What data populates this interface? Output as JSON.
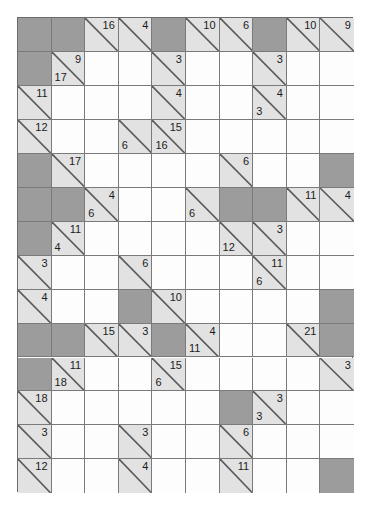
{
  "puzzle": {
    "name": "Kakuro Puzzle Grid",
    "type": "kakuro",
    "columns": 10,
    "rows": 14,
    "grid_origin": {
      "x": 17,
      "y": 17
    },
    "cell_width": 33.6,
    "cell_height": 33.95,
    "colors": {
      "block": "#9c9c9c",
      "clue": "#e2e2e2",
      "empty": "#fdfdfd",
      "grid_line": "#7a7a7a",
      "border": "#6b6b6b",
      "text": "#1b1b1b"
    },
    "legend": {
      "down_label": "down",
      "across_label": "across"
    },
    "cells": [
      {
        "r": 0,
        "c": 0,
        "kind": "block"
      },
      {
        "r": 0,
        "c": 1,
        "kind": "block"
      },
      {
        "r": 0,
        "c": 2,
        "kind": "clue",
        "down": "16"
      },
      {
        "r": 0,
        "c": 3,
        "kind": "clue",
        "down": "4"
      },
      {
        "r": 0,
        "c": 4,
        "kind": "block"
      },
      {
        "r": 0,
        "c": 5,
        "kind": "clue",
        "down": "10"
      },
      {
        "r": 0,
        "c": 6,
        "kind": "clue",
        "down": "6"
      },
      {
        "r": 0,
        "c": 7,
        "kind": "block"
      },
      {
        "r": 0,
        "c": 8,
        "kind": "clue",
        "down": "10"
      },
      {
        "r": 0,
        "c": 9,
        "kind": "clue",
        "down": "9"
      },
      {
        "r": 1,
        "c": 0,
        "kind": "block"
      },
      {
        "r": 1,
        "c": 1,
        "kind": "clue",
        "down": "9",
        "across": "17"
      },
      {
        "r": 1,
        "c": 2,
        "kind": "empty"
      },
      {
        "r": 1,
        "c": 3,
        "kind": "empty"
      },
      {
        "r": 1,
        "c": 4,
        "kind": "clue",
        "down": "3"
      },
      {
        "r": 1,
        "c": 5,
        "kind": "empty"
      },
      {
        "r": 1,
        "c": 6,
        "kind": "empty"
      },
      {
        "r": 1,
        "c": 7,
        "kind": "clue",
        "down": "3"
      },
      {
        "r": 1,
        "c": 8,
        "kind": "empty"
      },
      {
        "r": 1,
        "c": 9,
        "kind": "empty"
      },
      {
        "r": 2,
        "c": 0,
        "kind": "clue",
        "down": "11"
      },
      {
        "r": 2,
        "c": 1,
        "kind": "empty"
      },
      {
        "r": 2,
        "c": 2,
        "kind": "empty"
      },
      {
        "r": 2,
        "c": 3,
        "kind": "empty"
      },
      {
        "r": 2,
        "c": 4,
        "kind": "clue",
        "down": "4"
      },
      {
        "r": 2,
        "c": 5,
        "kind": "empty"
      },
      {
        "r": 2,
        "c": 6,
        "kind": "empty"
      },
      {
        "r": 2,
        "c": 7,
        "kind": "clue",
        "down": "4",
        "across": "3"
      },
      {
        "r": 2,
        "c": 8,
        "kind": "empty"
      },
      {
        "r": 2,
        "c": 9,
        "kind": "empty"
      },
      {
        "r": 3,
        "c": 0,
        "kind": "clue",
        "down": "12"
      },
      {
        "r": 3,
        "c": 1,
        "kind": "empty"
      },
      {
        "r": 3,
        "c": 2,
        "kind": "empty"
      },
      {
        "r": 3,
        "c": 3,
        "kind": "clue",
        "across": "6"
      },
      {
        "r": 3,
        "c": 4,
        "kind": "clue",
        "down": "15",
        "across": "16"
      },
      {
        "r": 3,
        "c": 5,
        "kind": "empty"
      },
      {
        "r": 3,
        "c": 6,
        "kind": "empty"
      },
      {
        "r": 3,
        "c": 7,
        "kind": "empty"
      },
      {
        "r": 3,
        "c": 8,
        "kind": "empty"
      },
      {
        "r": 3,
        "c": 9,
        "kind": "empty"
      },
      {
        "r": 4,
        "c": 0,
        "kind": "block"
      },
      {
        "r": 4,
        "c": 1,
        "kind": "clue",
        "down": "17"
      },
      {
        "r": 4,
        "c": 2,
        "kind": "empty"
      },
      {
        "r": 4,
        "c": 3,
        "kind": "empty"
      },
      {
        "r": 4,
        "c": 4,
        "kind": "empty"
      },
      {
        "r": 4,
        "c": 5,
        "kind": "empty"
      },
      {
        "r": 4,
        "c": 6,
        "kind": "clue",
        "down": "6"
      },
      {
        "r": 4,
        "c": 7,
        "kind": "empty"
      },
      {
        "r": 4,
        "c": 8,
        "kind": "empty"
      },
      {
        "r": 4,
        "c": 9,
        "kind": "block"
      },
      {
        "r": 5,
        "c": 0,
        "kind": "block"
      },
      {
        "r": 5,
        "c": 1,
        "kind": "block"
      },
      {
        "r": 5,
        "c": 2,
        "kind": "clue",
        "down": "4",
        "across": "6"
      },
      {
        "r": 5,
        "c": 3,
        "kind": "empty"
      },
      {
        "r": 5,
        "c": 4,
        "kind": "empty"
      },
      {
        "r": 5,
        "c": 5,
        "kind": "clue",
        "across": "6"
      },
      {
        "r": 5,
        "c": 6,
        "kind": "block"
      },
      {
        "r": 5,
        "c": 7,
        "kind": "block"
      },
      {
        "r": 5,
        "c": 8,
        "kind": "clue",
        "down": "11"
      },
      {
        "r": 5,
        "c": 9,
        "kind": "clue",
        "down": "4"
      },
      {
        "r": 6,
        "c": 0,
        "kind": "block"
      },
      {
        "r": 6,
        "c": 1,
        "kind": "clue",
        "down": "11",
        "across": "4"
      },
      {
        "r": 6,
        "c": 2,
        "kind": "empty"
      },
      {
        "r": 6,
        "c": 3,
        "kind": "empty"
      },
      {
        "r": 6,
        "c": 4,
        "kind": "empty"
      },
      {
        "r": 6,
        "c": 5,
        "kind": "empty"
      },
      {
        "r": 6,
        "c": 6,
        "kind": "clue",
        "across": "12"
      },
      {
        "r": 6,
        "c": 7,
        "kind": "clue",
        "down": "3"
      },
      {
        "r": 6,
        "c": 8,
        "kind": "empty"
      },
      {
        "r": 6,
        "c": 9,
        "kind": "empty"
      },
      {
        "r": 7,
        "c": 0,
        "kind": "clue",
        "down": "3"
      },
      {
        "r": 7,
        "c": 1,
        "kind": "empty"
      },
      {
        "r": 7,
        "c": 2,
        "kind": "empty"
      },
      {
        "r": 7,
        "c": 3,
        "kind": "clue",
        "down": "6"
      },
      {
        "r": 7,
        "c": 4,
        "kind": "empty"
      },
      {
        "r": 7,
        "c": 5,
        "kind": "empty"
      },
      {
        "r": 7,
        "c": 6,
        "kind": "empty"
      },
      {
        "r": 7,
        "c": 7,
        "kind": "clue",
        "down": "11",
        "across": "6"
      },
      {
        "r": 7,
        "c": 8,
        "kind": "empty"
      },
      {
        "r": 7,
        "c": 9,
        "kind": "empty"
      },
      {
        "r": 8,
        "c": 0,
        "kind": "clue",
        "down": "4"
      },
      {
        "r": 8,
        "c": 1,
        "kind": "empty"
      },
      {
        "r": 8,
        "c": 2,
        "kind": "empty"
      },
      {
        "r": 8,
        "c": 3,
        "kind": "block"
      },
      {
        "r": 8,
        "c": 4,
        "kind": "clue",
        "down": "10"
      },
      {
        "r": 8,
        "c": 5,
        "kind": "empty"
      },
      {
        "r": 8,
        "c": 6,
        "kind": "empty"
      },
      {
        "r": 8,
        "c": 7,
        "kind": "empty"
      },
      {
        "r": 8,
        "c": 8,
        "kind": "empty"
      },
      {
        "r": 8,
        "c": 9,
        "kind": "block"
      },
      {
        "r": 9,
        "c": 0,
        "kind": "block"
      },
      {
        "r": 9,
        "c": 1,
        "kind": "block"
      },
      {
        "r": 9,
        "c": 2,
        "kind": "clue",
        "down": "15"
      },
      {
        "r": 9,
        "c": 3,
        "kind": "clue",
        "down": "3"
      },
      {
        "r": 9,
        "c": 4,
        "kind": "block"
      },
      {
        "r": 9,
        "c": 5,
        "kind": "clue",
        "down": "4",
        "across": "11"
      },
      {
        "r": 9,
        "c": 6,
        "kind": "empty"
      },
      {
        "r": 9,
        "c": 7,
        "kind": "empty"
      },
      {
        "r": 9,
        "c": 8,
        "kind": "clue",
        "down": "21"
      },
      {
        "r": 9,
        "c": 9,
        "kind": "block"
      },
      {
        "r": 10,
        "c": 0,
        "kind": "block"
      },
      {
        "r": 10,
        "c": 1,
        "kind": "clue",
        "down": "11",
        "across": "18"
      },
      {
        "r": 10,
        "c": 2,
        "kind": "empty"
      },
      {
        "r": 10,
        "c": 3,
        "kind": "empty"
      },
      {
        "r": 10,
        "c": 4,
        "kind": "clue",
        "down": "15",
        "across": "6"
      },
      {
        "r": 10,
        "c": 5,
        "kind": "empty"
      },
      {
        "r": 10,
        "c": 6,
        "kind": "empty"
      },
      {
        "r": 10,
        "c": 7,
        "kind": "empty"
      },
      {
        "r": 10,
        "c": 8,
        "kind": "empty"
      },
      {
        "r": 10,
        "c": 9,
        "kind": "clue",
        "down": "3"
      },
      {
        "r": 11,
        "c": 0,
        "kind": "clue",
        "down": "18"
      },
      {
        "r": 11,
        "c": 1,
        "kind": "empty"
      },
      {
        "r": 11,
        "c": 2,
        "kind": "empty"
      },
      {
        "r": 11,
        "c": 3,
        "kind": "empty"
      },
      {
        "r": 11,
        "c": 4,
        "kind": "empty"
      },
      {
        "r": 11,
        "c": 5,
        "kind": "empty"
      },
      {
        "r": 11,
        "c": 6,
        "kind": "block"
      },
      {
        "r": 11,
        "c": 7,
        "kind": "clue",
        "down": "3",
        "across": "3"
      },
      {
        "r": 11,
        "c": 8,
        "kind": "empty"
      },
      {
        "r": 11,
        "c": 9,
        "kind": "empty"
      },
      {
        "r": 12,
        "c": 0,
        "kind": "clue",
        "down": "3"
      },
      {
        "r": 12,
        "c": 1,
        "kind": "empty"
      },
      {
        "r": 12,
        "c": 2,
        "kind": "empty"
      },
      {
        "r": 12,
        "c": 3,
        "kind": "clue",
        "down": "3"
      },
      {
        "r": 12,
        "c": 4,
        "kind": "empty"
      },
      {
        "r": 12,
        "c": 5,
        "kind": "empty"
      },
      {
        "r": 12,
        "c": 6,
        "kind": "clue",
        "down": "6"
      },
      {
        "r": 12,
        "c": 7,
        "kind": "empty"
      },
      {
        "r": 12,
        "c": 8,
        "kind": "empty"
      },
      {
        "r": 12,
        "c": 9,
        "kind": "empty"
      },
      {
        "r": 13,
        "c": 0,
        "kind": "clue",
        "down": "12"
      },
      {
        "r": 13,
        "c": 1,
        "kind": "empty"
      },
      {
        "r": 13,
        "c": 2,
        "kind": "empty"
      },
      {
        "r": 13,
        "c": 3,
        "kind": "clue",
        "down": "4"
      },
      {
        "r": 13,
        "c": 4,
        "kind": "empty"
      },
      {
        "r": 13,
        "c": 5,
        "kind": "empty"
      },
      {
        "r": 13,
        "c": 6,
        "kind": "clue",
        "down": "11"
      },
      {
        "r": 13,
        "c": 7,
        "kind": "empty"
      },
      {
        "r": 13,
        "c": 8,
        "kind": "empty"
      },
      {
        "r": 13,
        "c": 9,
        "kind": "block"
      }
    ]
  }
}
